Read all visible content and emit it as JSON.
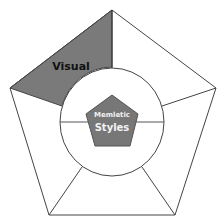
{
  "diagram": {
    "type": "pentagon-segmented",
    "center": {
      "line1": "Memletic",
      "line2": "Styles"
    },
    "segments": [
      {
        "label": "Visual",
        "highlighted": true
      },
      {
        "label": "",
        "highlighted": false
      },
      {
        "label": "",
        "highlighted": false
      },
      {
        "label": "",
        "highlighted": false
      },
      {
        "label": "",
        "highlighted": false
      }
    ],
    "colors": {
      "highlight": "#7a7a7a",
      "center": "#777777",
      "stroke": "#444444",
      "background": "#ffffff"
    }
  }
}
